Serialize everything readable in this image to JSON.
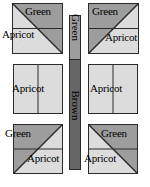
{
  "figure": {
    "colors": {
      "green": "#9d9d9d",
      "apricot": "#dcdcdc",
      "brown": "#666666",
      "outline": "#2b2b2b",
      "background": "#ffffff"
    }
  },
  "center_bar": {
    "name": "vertical-sashing-strip",
    "segments": [
      {
        "label": "Green",
        "color": "#9d9d9d",
        "share": 0.29
      },
      {
        "label": "Brown",
        "color": "#666666",
        "share": 0.71
      }
    ]
  },
  "blocks": [
    {
      "id": "top-left",
      "row": 0,
      "col": 0,
      "x": 12,
      "y": 3,
      "size": 51,
      "diagonal": "tl-br",
      "divider": "horizontal",
      "triangles": [
        {
          "position": "upper-right",
          "label": "Green",
          "color": "#9d9d9d"
        },
        {
          "position": "lower-left",
          "label": "Apricot",
          "color": "#dcdcdc"
        }
      ],
      "labels": [
        {
          "text": "Green",
          "x": 25,
          "y": 6
        },
        {
          "text": "Apricot",
          "x": 2,
          "y": 29
        }
      ]
    },
    {
      "id": "top-right",
      "row": 0,
      "col": 1,
      "x": 88,
      "y": 3,
      "size": 51,
      "diagonal": "bl-tr",
      "divider": "horizontal",
      "triangles": [
        {
          "position": "upper-left",
          "label": "Green",
          "color": "#9d9d9d"
        },
        {
          "position": "lower-right",
          "label": "Apricot",
          "color": "#dcdcdc"
        }
      ],
      "labels": [
        {
          "text": "Green",
          "x": 92,
          "y": 6
        },
        {
          "text": "Apricot",
          "x": 105,
          "y": 32
        }
      ]
    },
    {
      "id": "middle-left",
      "row": 1,
      "col": 0,
      "x": 13,
      "y": 64,
      "size": 50,
      "diagonal": "none",
      "divider": "vertical",
      "triangles": [
        {
          "position": "whole",
          "label": "Apricot",
          "color": "#dcdcdc"
        }
      ],
      "labels": [
        {
          "text": "Apricot",
          "x": 12,
          "y": 83
        }
      ]
    },
    {
      "id": "middle-right",
      "row": 1,
      "col": 1,
      "x": 88,
      "y": 64,
      "size": 50,
      "diagonal": "none",
      "divider": "vertical",
      "triangles": [
        {
          "position": "whole",
          "label": "Apricot",
          "color": "#dcdcdc"
        }
      ],
      "labels": [
        {
          "text": "Apricot",
          "x": 90,
          "y": 83
        }
      ]
    },
    {
      "id": "bottom-left",
      "row": 2,
      "col": 0,
      "x": 13,
      "y": 124,
      "size": 50,
      "diagonal": "bl-tr",
      "divider": "horizontal",
      "triangles": [
        {
          "position": "upper-left",
          "label": "Green",
          "color": "#9d9d9d"
        },
        {
          "position": "lower-right",
          "label": "Apricot",
          "color": "#dcdcdc"
        }
      ],
      "labels": [
        {
          "text": "Green",
          "x": 5,
          "y": 128
        },
        {
          "text": "Apricot",
          "x": 27,
          "y": 153
        }
      ]
    },
    {
      "id": "bottom-right",
      "row": 2,
      "col": 1,
      "x": 88,
      "y": 124,
      "size": 50,
      "diagonal": "tl-br",
      "divider": "horizontal",
      "triangles": [
        {
          "position": "upper-right",
          "label": "Green",
          "color": "#9d9d9d"
        },
        {
          "position": "lower-left",
          "label": "Apricot",
          "color": "#dcdcdc"
        }
      ],
      "labels": [
        {
          "text": "Green",
          "x": 101,
          "y": 128
        },
        {
          "text": "Apricot",
          "x": 84,
          "y": 153
        }
      ]
    }
  ]
}
